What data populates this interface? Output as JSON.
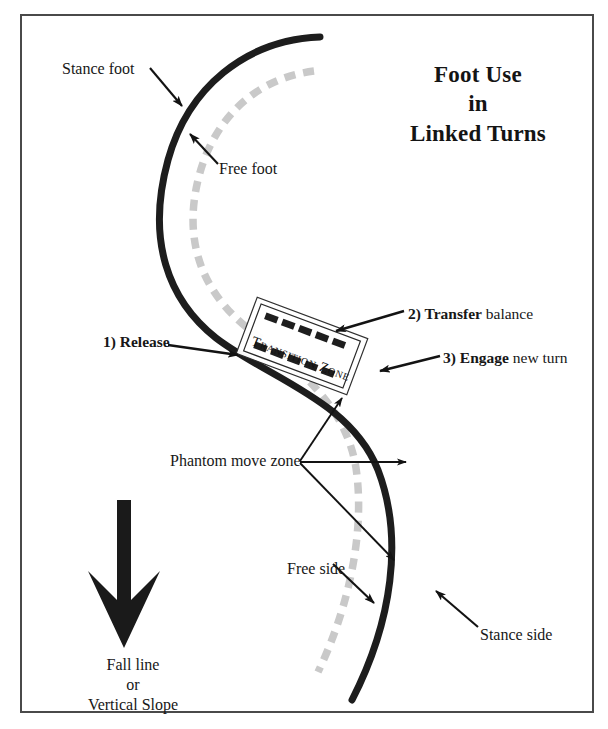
{
  "figure": {
    "title_lines": [
      "Foot Use",
      "in",
      "Linked Turns"
    ],
    "frame": {
      "border_color": "#4a4a4a"
    }
  },
  "labels": {
    "stance_foot": "Stance foot",
    "free_foot": "Free foot",
    "release_step": "1) Release",
    "transfer_bold": "2) Transfer",
    "transfer_rest": " balance",
    "engage_bold": "3) Engage",
    "engage_rest": " new turn",
    "phantom_move_zone": "Phantom move zone",
    "free_side": "Free side",
    "stance_side": "Stance side",
    "transition_zone": "Transition Zone",
    "fall_line_lines": [
      "Fall line",
      "or",
      "Vertical Slope"
    ]
  },
  "colors": {
    "stance_track": "#1d1d1d",
    "free_track": "#c9c9c9",
    "arrow": "#131313",
    "text": "#171717",
    "frame_border": "#4a4a4a",
    "fall_arrow": "#1a1a1a",
    "zone_box_border": "#2a2a2a",
    "zone_dash": "#1e1e1e"
  },
  "diagram": {
    "type": "annotated-illustration",
    "tracks": [
      {
        "name": "stance-foot-track",
        "style": "solid",
        "color": "#1d1d1d",
        "width": 7,
        "path": "M 320,37 C 245,40 188,88 168,160 C 146,240 168,300 216,338 C 268,378 350,400 378,470 C 404,538 392,622 352,700"
      },
      {
        "name": "free-foot-track",
        "style": "dashed",
        "color": "#c9c9c9",
        "width": 7,
        "path": "M 314,71 C 252,79 212,122 198,180 C 182,246 206,296 250,330 C 300,370 346,406 356,468 C 366,536 346,614 318,672"
      }
    ],
    "transition_zone": {
      "name": "transition-zone-box",
      "center_x": 302,
      "center_y": 346,
      "width": 118,
      "height": 60,
      "rotation_deg": 20.5,
      "double_border": true,
      "dash_rows": 2
    },
    "fall_line_arrow": {
      "name": "fall-line-arrow",
      "x": 124,
      "top_y": 500,
      "tip_y": 648,
      "shaft_width": 13,
      "head_half_width": 36,
      "barbed": true
    },
    "annotation_arrows": [
      {
        "name": "stance-foot-arrow",
        "from": [
          152,
          70
        ],
        "to": [
          182,
          105
        ]
      },
      {
        "name": "free-foot-arrow",
        "from": [
          216,
          165
        ],
        "to": [
          190,
          135
        ]
      },
      {
        "name": "release-arrow",
        "from": [
          170,
          346
        ],
        "to": [
          236,
          354
        ]
      },
      {
        "name": "transfer-arrow",
        "from": [
          404,
          312
        ],
        "to": [
          337,
          330
        ]
      },
      {
        "name": "engage-arrow",
        "from": [
          440,
          357
        ],
        "to": [
          382,
          370
        ]
      },
      {
        "name": "phantom-arrow-up",
        "from": [
          300,
          462
        ],
        "to": [
          340,
          396
        ]
      },
      {
        "name": "phantom-arrow-mid",
        "from": [
          300,
          462
        ],
        "to": [
          405,
          462
        ]
      },
      {
        "name": "phantom-arrow-down",
        "from": [
          300,
          462
        ],
        "to": [
          394,
          559
        ]
      },
      {
        "name": "free-side-arrow",
        "from": [
          335,
          566
        ],
        "to": [
          374,
          602
        ]
      },
      {
        "name": "stance-side-arrow",
        "from": [
          478,
          628
        ],
        "to": [
          437,
          592
        ]
      }
    ]
  }
}
